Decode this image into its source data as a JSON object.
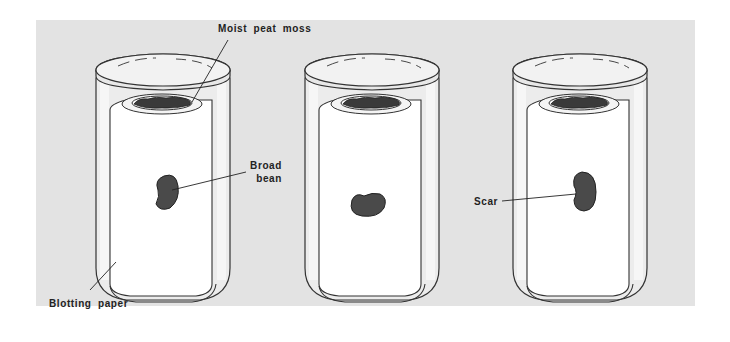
{
  "figure": {
    "type": "experiment-illustration",
    "colors": {
      "panel_background": "#e3e3e3",
      "page_background": "#ffffff",
      "outline": "#333333",
      "bean": "#4a4a4a",
      "peat": "#3a3a3a",
      "paper": "#ffffff",
      "glass_highlight": "#f4f4f4"
    }
  },
  "jars": [
    {
      "index": 1,
      "bean_orientation": "scar facing right, upright"
    },
    {
      "index": 2,
      "bean_orientation": "lying horizontally, scar facing up"
    },
    {
      "index": 3,
      "bean_orientation": "scar facing left, upright"
    }
  ],
  "labels": {
    "moist_peat_moss": "Moist peat moss",
    "broad_bean_line1": "Broad",
    "broad_bean_line2": "bean",
    "blotting_paper": "Blotting paper",
    "scar": "Scar"
  }
}
